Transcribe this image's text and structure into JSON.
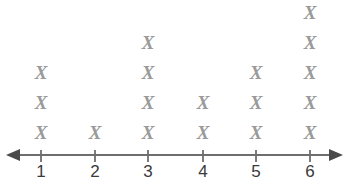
{
  "chart_data": {
    "type": "bar",
    "plot_style": "dot-plot-x-marks",
    "title": "",
    "subtitle": "",
    "xlabel": "",
    "ylabel": "",
    "categories": [
      "1",
      "2",
      "3",
      "4",
      "5",
      "6"
    ],
    "values": [
      3,
      1,
      4,
      2,
      3,
      5
    ],
    "total_marks": 18,
    "mark_glyph": "X",
    "axis": {
      "kind": "number-line",
      "left_arrow": true,
      "right_arrow": true,
      "xlim": [
        1,
        6
      ],
      "tick_labels": [
        "1",
        "2",
        "3",
        "4",
        "5",
        "6"
      ],
      "grid": false
    },
    "legend": {
      "entries": [],
      "position": "none"
    },
    "colors": {
      "mark": "#9a9a9a",
      "axis": "#6e6e6e",
      "tick_label": "#3a3a3a",
      "background": "#ffffff"
    }
  },
  "marks": {
    "glyph": "X",
    "columns": [
      {
        "category": "1",
        "count": 3,
        "x": 41
      },
      {
        "category": "2",
        "count": 1,
        "x": 95
      },
      {
        "category": "3",
        "count": 4,
        "x": 148
      },
      {
        "category": "4",
        "count": 2,
        "x": 203
      },
      {
        "category": "5",
        "count": 3,
        "x": 256
      },
      {
        "category": "6",
        "count": 5,
        "x": 310
      }
    ]
  }
}
